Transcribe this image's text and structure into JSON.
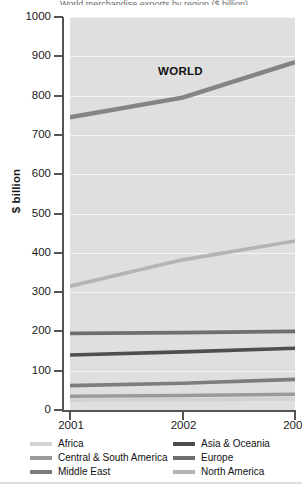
{
  "figure": {
    "title_sliver": "World merchandise exports by region ($ billion)",
    "world_annotation": "WORLD"
  },
  "axes": {
    "y_label": "$ billion",
    "y_ticks": [
      "1000",
      "900",
      "800",
      "700",
      "600",
      "500",
      "400",
      "300",
      "200",
      "100",
      "0"
    ],
    "x_ticks": [
      "2001",
      "2002",
      "2003"
    ]
  },
  "legend": {
    "left_column": [
      {
        "label": "Africa",
        "color": "#d2d2d2"
      },
      {
        "label": "Central & South America",
        "color": "#9a9a9a"
      },
      {
        "label": "Middle East",
        "color": "#7d7d7d"
      }
    ],
    "right_column": [
      {
        "label": "Asia & Oceania",
        "color": "#4e4e4e"
      },
      {
        "label": "Europe",
        "color": "#6e6e6e"
      },
      {
        "label": "North America",
        "color": "#b4b4b4"
      }
    ]
  },
  "colors": {
    "plot_background": "#dfdfdf",
    "gridline": "#f4f4f4",
    "axis": "#545454",
    "world_line": "#848484",
    "text": "#1a1a1a"
  },
  "chart_data": {
    "type": "line",
    "title": "World merchandise exports by region ($ billion)",
    "xlabel": "",
    "ylabel": "$ billion",
    "x": [
      "2001",
      "2002",
      "2003"
    ],
    "ylim": [
      0,
      1000
    ],
    "ytick_step": 100,
    "grid": true,
    "legend_position": "bottom",
    "annotations": [
      {
        "text": "WORLD",
        "series": "WORLD",
        "x": "2002",
        "y": 800
      }
    ],
    "series": [
      {
        "name": "WORLD",
        "color": "#848484",
        "values": [
          745,
          795,
          885
        ]
      },
      {
        "name": "North America",
        "color": "#b4b4b4",
        "values": [
          315,
          382,
          430
        ]
      },
      {
        "name": "Europe",
        "color": "#6e6e6e",
        "values": [
          195,
          197,
          200
        ]
      },
      {
        "name": "Asia & Oceania",
        "color": "#4e4e4e",
        "values": [
          140,
          148,
          157
        ]
      },
      {
        "name": "Middle East",
        "color": "#7d7d7d",
        "values": [
          62,
          68,
          78
        ]
      },
      {
        "name": "Central & South America",
        "color": "#9a9a9a",
        "values": [
          35,
          37,
          40
        ]
      },
      {
        "name": "Africa",
        "color": "#d2d2d2",
        "values": [
          25,
          26,
          28
        ]
      }
    ]
  }
}
